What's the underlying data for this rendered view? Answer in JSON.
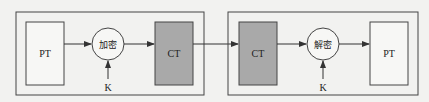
{
  "diagram": {
    "colors": {
      "background": "#f2f2f0",
      "stroke": "#444444",
      "ciphertext_fill": "#a9a9a9",
      "plaintext_fill": "#f7f7f5"
    },
    "encrypt_group": {
      "plaintext_label": "PT",
      "operation_label": "加密",
      "key_label": "K",
      "ciphertext_label": "CT"
    },
    "decrypt_group": {
      "ciphertext_label": "CT",
      "operation_label": "解密",
      "key_label": "K",
      "plaintext_label": "PT"
    }
  }
}
